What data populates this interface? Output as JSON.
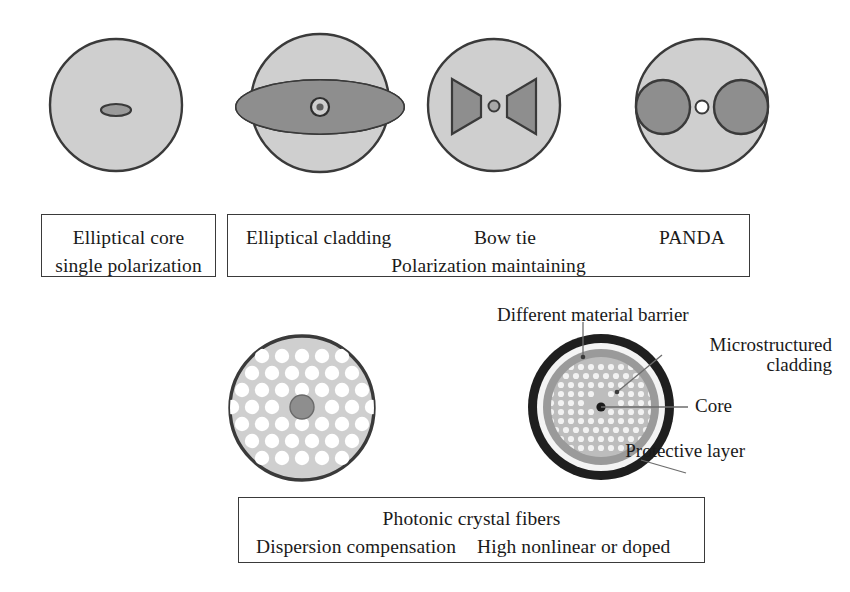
{
  "figure": {
    "title_absent": true,
    "background_color": "#ffffff",
    "palette": {
      "cladding_light": "#cfcfcf",
      "stress_gray": "#8e8e8e",
      "outline_dark": "#3a3a3a",
      "core_dark": "#6f6f6f",
      "hole_white": "#ffffff",
      "barrier_black": "#1f1f1f",
      "ring_white": "#f4f4f4",
      "ring_mid": "#b5b5b5",
      "ring_dark": "#9a9a9a",
      "inner_field": "#bdbdbd",
      "text": "#1a1a1a"
    }
  },
  "row1": {
    "diagrams": [
      {
        "name": "elliptical-core-fiber",
        "kind": "circle-with-small-ellipse-core"
      },
      {
        "name": "elliptical-cladding-fiber",
        "kind": "circle-with-large-ellipse-and-ring-core"
      },
      {
        "name": "bow-tie-fiber",
        "kind": "circle-with-two-trapezoids-and-dot-core"
      },
      {
        "name": "panda-fiber",
        "kind": "circle-with-two-disks-and-ring-core"
      }
    ],
    "box_left": {
      "lines": [
        "Elliptical core",
        "single polarization"
      ]
    },
    "box_right": {
      "headers": [
        "Elliptical cladding",
        "Bow tie",
        "PANDA"
      ],
      "subtitle": "Polarization maintaining"
    }
  },
  "row2": {
    "diagrams": [
      {
        "name": "photonic-crystal-fiber-solid-core",
        "kind": "hex-lattice-holes-dark-core"
      },
      {
        "name": "photonic-crystal-fiber-layered",
        "kind": "concentric-layers-hex-lattice"
      }
    ],
    "annotations": [
      {
        "name": "different-material-barrier-label",
        "text": "Different material barrier"
      },
      {
        "name": "microstructured-cladding-label",
        "text": "Microstructured cladding"
      },
      {
        "name": "core-label",
        "text": "Core"
      },
      {
        "name": "protective-layer-label",
        "text": "Protective layer"
      }
    ],
    "box": {
      "title": "Photonic crystal fibers",
      "left_label": "Dispersion compensation",
      "right_label": "High nonlinear or doped"
    }
  }
}
